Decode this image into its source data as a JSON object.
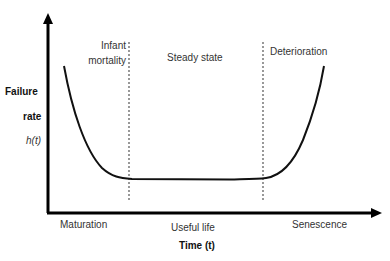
{
  "diagram": {
    "y_axis": {
      "label_line1": "Failure",
      "label_line2": "rate",
      "symbol": "h(t)"
    },
    "x_axis": {
      "label": "Time (t)"
    },
    "regions_top": [
      "Infant mortality",
      "Steady state",
      "Deterioration"
    ],
    "infant_line1": "Infant",
    "infant_line2": "mortality",
    "regions_bottom": [
      "Maturation",
      "Useful life",
      "Senescence"
    ],
    "colors": {
      "curve": "#111111",
      "axis": "#000000",
      "divider": "#555555"
    }
  }
}
